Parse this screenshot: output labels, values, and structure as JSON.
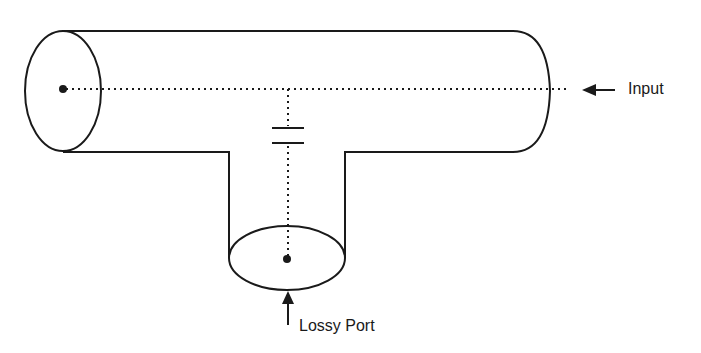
{
  "diagram": {
    "type": "transmission-line-tee",
    "labels": {
      "input": "Input",
      "lossy_port": "Lossy Port"
    },
    "elements": [
      {
        "id": "main-line",
        "kind": "cylinder",
        "orientation": "horizontal"
      },
      {
        "id": "stub",
        "kind": "cylinder",
        "orientation": "vertical"
      },
      {
        "id": "coupling-capacitor",
        "kind": "capacitor"
      },
      {
        "id": "input-arrow",
        "kind": "arrow",
        "direction": "left"
      },
      {
        "id": "lossy-port-arrow",
        "kind": "arrow",
        "direction": "up"
      }
    ],
    "colors": {
      "stroke": "#1a1a1a",
      "background": "#ffffff"
    }
  }
}
